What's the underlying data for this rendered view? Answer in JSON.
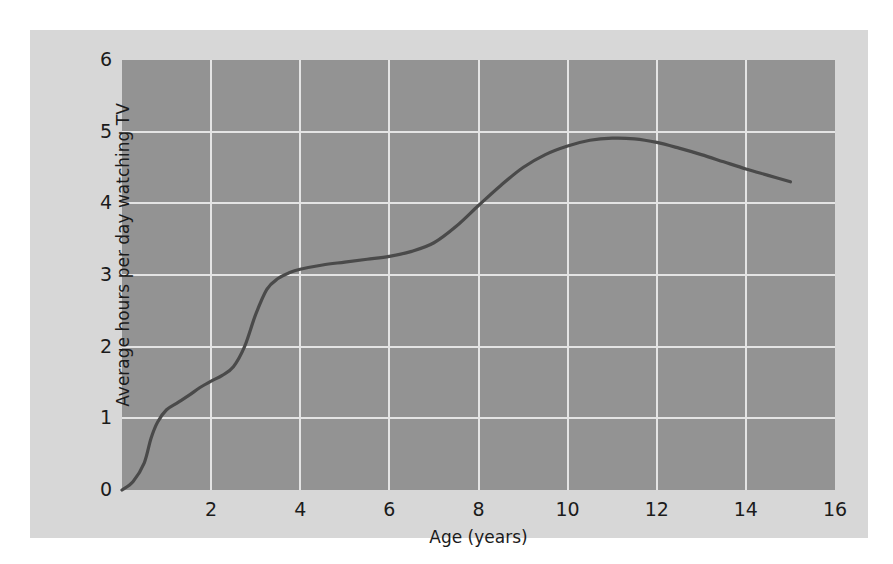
{
  "chart_data": {
    "type": "line",
    "title": "",
    "subtitle": "",
    "xlabel": "Age (years)",
    "ylabel": "Average hours per day watching TV",
    "xlim": [
      0,
      16
    ],
    "ylim": [
      0,
      6
    ],
    "xticks": [
      "2",
      "4",
      "6",
      "8",
      "10",
      "12",
      "14",
      "16"
    ],
    "xtick_values": [
      2,
      4,
      6,
      8,
      10,
      12,
      14,
      16
    ],
    "yticks": [
      "0",
      "1",
      "2",
      "3",
      "4",
      "5",
      "6"
    ],
    "ytick_values": [
      0,
      1,
      2,
      3,
      4,
      5,
      6
    ],
    "grid": true,
    "legend": null,
    "legend_position": "none",
    "series": [
      {
        "name": "Average hours per day watching TV",
        "x": [
          0.0,
          0.25,
          0.5,
          0.65,
          0.8,
          1.0,
          1.25,
          1.5,
          1.75,
          2.0,
          2.25,
          2.5,
          2.75,
          3.0,
          3.25,
          3.5,
          3.75,
          4.0,
          4.5,
          5.0,
          5.5,
          6.0,
          6.5,
          7.0,
          7.5,
          8.0,
          8.5,
          9.0,
          9.5,
          10.0,
          10.5,
          11.0,
          11.5,
          12.0,
          12.5,
          13.0,
          13.5,
          14.0,
          14.5,
          15.0
        ],
        "y": [
          0.0,
          0.12,
          0.38,
          0.72,
          0.95,
          1.12,
          1.22,
          1.32,
          1.43,
          1.52,
          1.6,
          1.72,
          2.0,
          2.45,
          2.8,
          2.95,
          3.03,
          3.08,
          3.14,
          3.18,
          3.22,
          3.26,
          3.33,
          3.45,
          3.68,
          3.97,
          4.25,
          4.5,
          4.68,
          4.8,
          4.88,
          4.91,
          4.9,
          4.85,
          4.77,
          4.68,
          4.58,
          4.48,
          4.39,
          4.3
        ]
      }
    ],
    "colors": {
      "figure_background": "#d7d7d7",
      "plot_background": "#939393",
      "gridline": "#e4e4e4",
      "line": "#4a4a4a",
      "text": "#1b1b1b"
    }
  }
}
